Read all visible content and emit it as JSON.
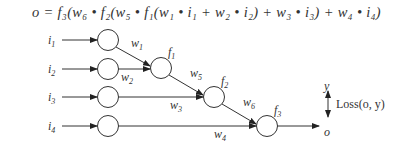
{
  "formula": "o = f₃(w₆ • f₂(w₅ • f₁(w₁ • i₁ + w₂ • i₂) + w₃ • i₃) + w₄ • i₄)",
  "inputs": [
    {
      "label": "i",
      "sub": "1"
    },
    {
      "label": "i",
      "sub": "2"
    },
    {
      "label": "i",
      "sub": "3"
    },
    {
      "label": "i",
      "sub": "4"
    }
  ],
  "functions": [
    {
      "label": "f",
      "sub": "1"
    },
    {
      "label": "f",
      "sub": "2"
    },
    {
      "label": "f",
      "sub": "3"
    }
  ],
  "weights": [
    {
      "label": "w",
      "sub": "1"
    },
    {
      "label": "w",
      "sub": "2"
    },
    {
      "label": "w",
      "sub": "3"
    },
    {
      "label": "w",
      "sub": "4"
    },
    {
      "label": "w",
      "sub": "5"
    },
    {
      "label": "w",
      "sub": "6"
    }
  ],
  "output": {
    "label": "o",
    "target": "y",
    "loss": "Loss(o, y)"
  }
}
